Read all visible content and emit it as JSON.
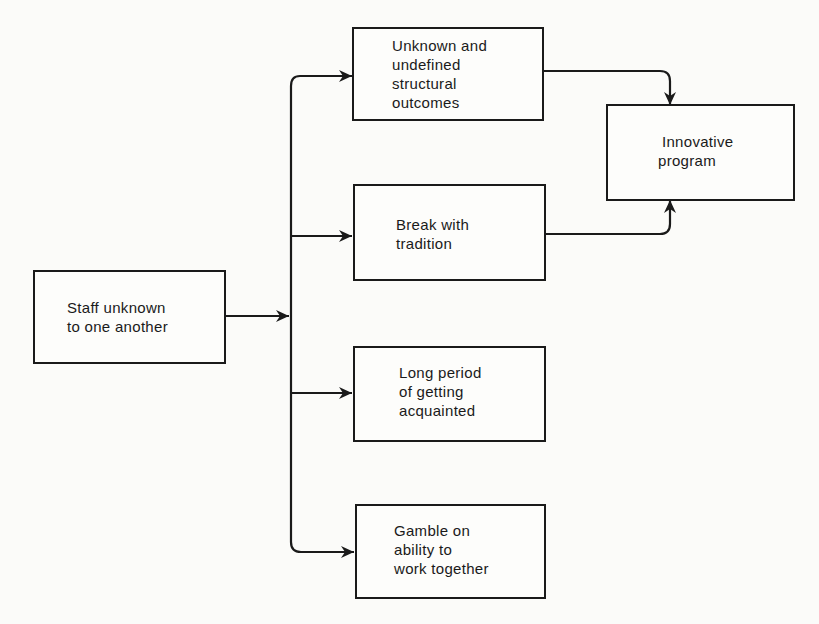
{
  "diagram": {
    "type": "flowchart",
    "colors": {
      "ink": "#1a1a1a",
      "background": "#fbfbf9"
    },
    "nodes": {
      "staff": {
        "lines": [
          "Staff unknown",
          "to one another"
        ]
      },
      "unknown_outcomes": {
        "lines": [
          "Unknown and",
          "undefined",
          "structural",
          "outcomes"
        ]
      },
      "break_tradition": {
        "lines": [
          "Break with",
          "tradition"
        ]
      },
      "long_period": {
        "lines": [
          "Long period",
          "of getting",
          "acquainted"
        ]
      },
      "gamble": {
        "lines": [
          "Gamble on",
          "ability to",
          "work together"
        ]
      },
      "innovative": {
        "lines": [
          "Innovative",
          "program"
        ]
      }
    },
    "edges": [
      {
        "from": "staff",
        "to": "unknown_outcomes"
      },
      {
        "from": "staff",
        "to": "break_tradition"
      },
      {
        "from": "staff",
        "to": "long_period"
      },
      {
        "from": "staff",
        "to": "gamble"
      },
      {
        "from": "unknown_outcomes",
        "to": "innovative"
      },
      {
        "from": "break_tradition",
        "to": "innovative"
      }
    ]
  }
}
